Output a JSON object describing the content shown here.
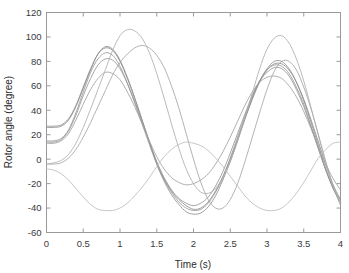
{
  "figure": {
    "background_color": "#ffffff",
    "axes_color": "#9a9a9a",
    "text_color": "#3a3a3a"
  },
  "chart_data": {
    "type": "line",
    "title": "",
    "xlabel": "Time (s)",
    "ylabel": "Rotor angle (degree)",
    "xlim": [
      0,
      4
    ],
    "ylim": [
      -60,
      120
    ],
    "xticks": [
      0,
      0.5,
      1,
      1.5,
      2,
      2.5,
      3,
      3.5,
      4
    ],
    "xticklabels": [
      "0",
      "0.5",
      "1",
      "1.5",
      "2",
      "2.5",
      "3",
      "3.5",
      "4"
    ],
    "yticks": [
      -60,
      -40,
      -20,
      0,
      20,
      40,
      60,
      80,
      100,
      120
    ],
    "yticklabels": [
      "-60",
      "-40",
      "-20",
      "0",
      "20",
      "40",
      "60",
      "80",
      "100",
      "120"
    ],
    "grid": false,
    "legend": "none",
    "x_sample_step": 0.1,
    "x": [
      0,
      0.1,
      0.2,
      0.3,
      0.4,
      0.5,
      0.6,
      0.7,
      0.8,
      0.9,
      1,
      1.1,
      1.2,
      1.3,
      1.4,
      1.5,
      1.6,
      1.7,
      1.8,
      1.9,
      2,
      2.1,
      2.2,
      2.3,
      2.4,
      2.5,
      2.6,
      2.7,
      2.8,
      2.9,
      3,
      3.1,
      3.2,
      3.3,
      3.4,
      3.5,
      3.6,
      3.7,
      3.8,
      3.9,
      4
    ],
    "series": [
      {
        "name": "Generator 1",
        "color": "#8c8c8c",
        "values": [
          27,
          27,
          28,
          33,
          44,
          59,
          74,
          86,
          91,
          89,
          80,
          66,
          50,
          32,
          14,
          -3,
          -16,
          -26,
          -33,
          -38,
          -41,
          -40,
          -35,
          -26,
          -14,
          0,
          16,
          33,
          49,
          63,
          73,
          78,
          78,
          73,
          63,
          49,
          32,
          14,
          -5,
          -21,
          -33
        ]
      },
      {
        "name": "Generator 2",
        "color": "#8f8f8f",
        "values": [
          26,
          26,
          27,
          32,
          43,
          58,
          73,
          86,
          92,
          90,
          81,
          67,
          50,
          32,
          14,
          -4,
          -18,
          -29,
          -37,
          -43,
          -45,
          -44,
          -39,
          -30,
          -17,
          -2,
          15,
          33,
          50,
          64,
          74,
          80,
          80,
          74,
          63,
          48,
          30,
          11,
          -8,
          -24,
          -36
        ]
      },
      {
        "name": "Generator 3",
        "color": "#9a9a9a",
        "values": [
          15,
          15,
          17,
          24,
          38,
          55,
          71,
          82,
          87,
          85,
          76,
          62,
          46,
          29,
          12,
          -4,
          -17,
          -27,
          -35,
          -40,
          -42,
          -41,
          -36,
          -27,
          -15,
          1,
          18,
          35,
          51,
          64,
          73,
          77,
          76,
          70,
          59,
          45,
          27,
          9,
          -9,
          -24,
          -35
        ]
      },
      {
        "name": "Generator 4",
        "color": "#959595",
        "values": [
          14,
          14,
          16,
          23,
          36,
          52,
          66,
          77,
          82,
          81,
          74,
          62,
          47,
          31,
          14,
          -2,
          -15,
          -25,
          -32,
          -36,
          -38,
          -36,
          -31,
          -22,
          -10,
          5,
          21,
          37,
          52,
          64,
          71,
          75,
          74,
          68,
          57,
          43,
          26,
          8,
          -9,
          -23,
          -33
        ]
      },
      {
        "name": "Generator 5",
        "color": "#a0a0a0",
        "values": [
          13,
          13,
          15,
          21,
          32,
          45,
          57,
          66,
          71,
          70,
          65,
          55,
          43,
          29,
          15,
          2,
          -8,
          -15,
          -19,
          -21,
          -20,
          -17,
          -12,
          -4,
          6,
          18,
          31,
          44,
          55,
          63,
          67,
          68,
          66,
          60,
          51,
          39,
          25,
          10,
          -4,
          -16,
          -25
        ]
      },
      {
        "name": "Generator 6",
        "color": "#a5a5a5",
        "values": [
          -4,
          -4,
          -3,
          1,
          8,
          18,
          30,
          43,
          56,
          69,
          79,
          86,
          91,
          93,
          91,
          85,
          75,
          60,
          42,
          21,
          0,
          -19,
          -33,
          -40,
          -40,
          -33,
          -20,
          -2,
          18,
          38,
          57,
          72,
          80,
          80,
          73,
          59,
          41,
          20,
          -2,
          -22,
          -38
        ]
      },
      {
        "name": "Generator 7",
        "color": "#adadad",
        "values": [
          -4,
          -3,
          -1,
          4,
          13,
          26,
          41,
          57,
          73,
          89,
          101,
          106,
          105,
          99,
          87,
          70,
          50,
          29,
          9,
          -8,
          -20,
          -27,
          -28,
          -24,
          -15,
          -2,
          15,
          34,
          54,
          74,
          90,
          99,
          101,
          95,
          82,
          64,
          42,
          19,
          -3,
          -22,
          -35
        ]
      },
      {
        "name": "Generator 8",
        "color": "#bcbcbc",
        "values": [
          -8,
          -9,
          -12,
          -17,
          -24,
          -31,
          -37,
          -41,
          -42,
          -42,
          -40,
          -36,
          -30,
          -23,
          -15,
          -6,
          2,
          8,
          12,
          14,
          13,
          11,
          7,
          1,
          -6,
          -14,
          -22,
          -30,
          -36,
          -40,
          -42,
          -42,
          -40,
          -35,
          -28,
          -19,
          -9,
          1,
          8,
          13,
          14
        ]
      }
    ]
  }
}
